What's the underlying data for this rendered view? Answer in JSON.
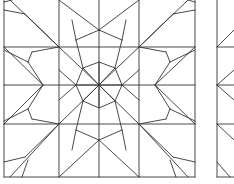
{
  "figure": {
    "stroke": "#333333",
    "background": "#ffffff",
    "center": [
      99,
      85
    ],
    "octagon": [
      [
        99,
        62
      ],
      [
        115,
        68
      ],
      [
        122,
        85
      ],
      [
        115,
        101
      ],
      [
        99,
        108
      ],
      [
        83,
        101
      ],
      [
        76,
        85
      ],
      [
        83,
        68
      ]
    ],
    "lines": [
      [
        4,
        0,
        4,
        177
      ],
      [
        59,
        0,
        59,
        177
      ],
      [
        139,
        0,
        139,
        177
      ],
      [
        195,
        0,
        195,
        177
      ],
      [
        99,
        0,
        99,
        177
      ],
      [
        4,
        47,
        195,
        47
      ],
      [
        4,
        85,
        195,
        85
      ],
      [
        4,
        124,
        195,
        124
      ],
      [
        4,
        177,
        195,
        177
      ],
      [
        99,
        85,
        59,
        47
      ],
      [
        99,
        85,
        139,
        47
      ],
      [
        99,
        85,
        59,
        124
      ],
      [
        99,
        85,
        139,
        124
      ],
      [
        59,
        47,
        10,
        0
      ],
      [
        139,
        47,
        188,
        0
      ],
      [
        59,
        124,
        10,
        177
      ],
      [
        139,
        124,
        188,
        177
      ],
      [
        59,
        47,
        25,
        14
      ],
      [
        25,
        14,
        4,
        10
      ],
      [
        59,
        47,
        32,
        52
      ],
      [
        32,
        52,
        28,
        62
      ],
      [
        139,
        47,
        173,
        14
      ],
      [
        173,
        14,
        195,
        10
      ],
      [
        139,
        47,
        166,
        52
      ],
      [
        166,
        52,
        170,
        62
      ],
      [
        59,
        124,
        32,
        119
      ],
      [
        32,
        119,
        28,
        109
      ],
      [
        59,
        124,
        25,
        157
      ],
      [
        25,
        157,
        4,
        162
      ],
      [
        139,
        124,
        166,
        119
      ],
      [
        166,
        119,
        170,
        109
      ],
      [
        139,
        124,
        173,
        157
      ],
      [
        173,
        157,
        195,
        162
      ],
      [
        43,
        85,
        4,
        47
      ],
      [
        43,
        85,
        4,
        124
      ],
      [
        43,
        85,
        28,
        62
      ],
      [
        43,
        85,
        28,
        109
      ],
      [
        28,
        62,
        4,
        50
      ],
      [
        28,
        109,
        4,
        121
      ],
      [
        155,
        85,
        195,
        47
      ],
      [
        155,
        85,
        195,
        124
      ],
      [
        155,
        85,
        170,
        62
      ],
      [
        155,
        85,
        170,
        109
      ],
      [
        170,
        62,
        195,
        50
      ],
      [
        170,
        109,
        195,
        121
      ],
      [
        99,
        30,
        59,
        0
      ],
      [
        99,
        30,
        139,
        0
      ],
      [
        99,
        30,
        76,
        40
      ],
      [
        99,
        30,
        122,
        40
      ],
      [
        76,
        40,
        72,
        20
      ],
      [
        122,
        40,
        126,
        20
      ],
      [
        99,
        140,
        59,
        177
      ],
      [
        99,
        140,
        139,
        177
      ],
      [
        99,
        140,
        76,
        130
      ],
      [
        99,
        140,
        122,
        130
      ],
      [
        76,
        130,
        72,
        150
      ],
      [
        122,
        130,
        126,
        150
      ],
      [
        83,
        68,
        76,
        40
      ],
      [
        115,
        68,
        122,
        40
      ],
      [
        83,
        101,
        76,
        130
      ],
      [
        115,
        101,
        122,
        130
      ],
      [
        76,
        85,
        59,
        70
      ],
      [
        122,
        85,
        139,
        70
      ],
      [
        76,
        85,
        59,
        100
      ],
      [
        122,
        85,
        139,
        100
      ],
      [
        4,
        2,
        12,
        0
      ],
      [
        195,
        2,
        188,
        0
      ],
      [
        22,
        177,
        28,
        160
      ],
      [
        176,
        177,
        170,
        160
      ],
      [
        217,
        0,
        217,
        177
      ],
      [
        217,
        47,
        234,
        47
      ],
      [
        217,
        85,
        234,
        85
      ],
      [
        217,
        124,
        234,
        124
      ],
      [
        217,
        177,
        234,
        177
      ],
      [
        217,
        47,
        234,
        30
      ],
      [
        217,
        124,
        234,
        140
      ],
      [
        217,
        85,
        234,
        70
      ],
      [
        217,
        85,
        234,
        100
      ],
      [
        217,
        162,
        230,
        177
      ]
    ]
  }
}
